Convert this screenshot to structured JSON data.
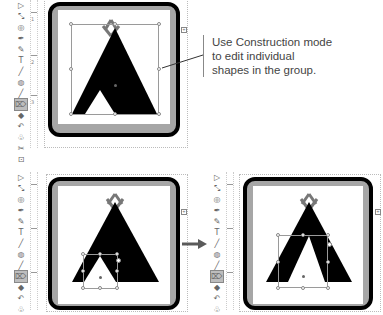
{
  "callout": {
    "lines": [
      "Use Construction mode",
      "to edit individual",
      "shapes in the group."
    ]
  },
  "toolbar": {
    "tools": [
      {
        "name": "pointer-tool",
        "glyph": "▷"
      },
      {
        "name": "node-tool",
        "glyph": "⤡"
      },
      {
        "name": "zoom-tool",
        "glyph": "◎"
      },
      {
        "name": "pen-tool",
        "glyph": "✒"
      },
      {
        "name": "paint-tool",
        "glyph": "✎"
      },
      {
        "name": "text-tool",
        "glyph": "T"
      },
      {
        "name": "line-tool",
        "glyph": "╱"
      },
      {
        "name": "ellipse-tool",
        "glyph": "◍"
      },
      {
        "name": "brush-tool",
        "glyph": "╱"
      },
      {
        "name": "construction-tool",
        "glyph": "⌦",
        "active": true
      },
      {
        "name": "fill-tool",
        "glyph": "◆"
      },
      {
        "name": "lasso-tool",
        "glyph": "↶"
      },
      {
        "name": "stamp-tool",
        "glyph": "♧"
      },
      {
        "name": "shape-tool",
        "glyph": "✂"
      },
      {
        "name": "crop-tool",
        "glyph": "⊡"
      }
    ]
  },
  "colors": {
    "frame_border": "#000000",
    "frame_fill": "#a6a6a6",
    "teepee": "#000000",
    "poles": "#777777",
    "arrow": "#5a5a5a"
  },
  "ruler": {
    "labels": [
      "1",
      "2",
      "3"
    ]
  }
}
